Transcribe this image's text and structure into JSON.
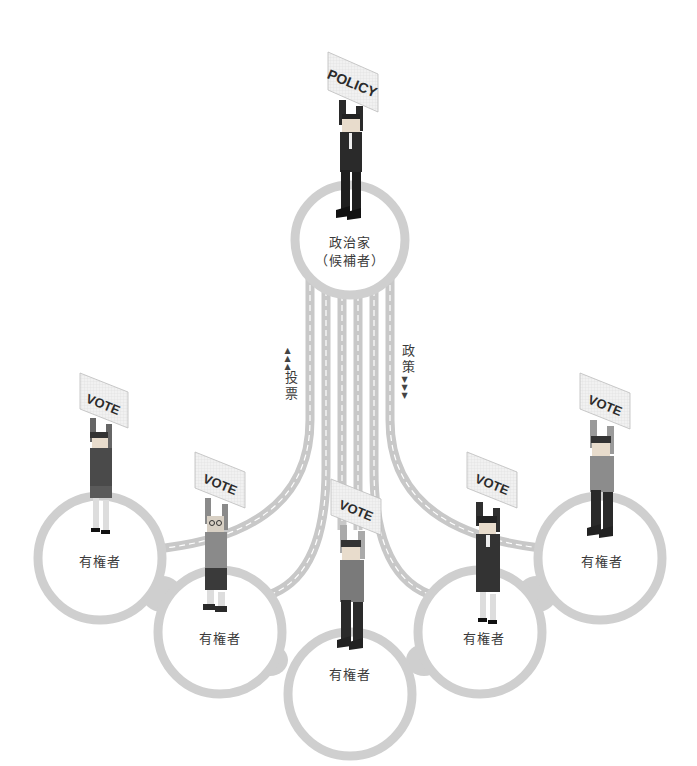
{
  "diagram": {
    "type": "illustration-network",
    "colors": {
      "ring": "#cfcfcf",
      "road": "#c8c8c8",
      "road_line": "#ffffff",
      "text": "#3a3a3a",
      "sign_fill": "#eeeeee",
      "sign_text": "#2b2b2b"
    },
    "politician": {
      "label_line1": "政治家",
      "label_line2": "（候補者）",
      "sign": "POLICY"
    },
    "flows": {
      "up": {
        "arrows": "▲▲▲",
        "chars": [
          "投",
          "票"
        ]
      },
      "down": {
        "chars": [
          "政",
          "策"
        ],
        "arrows": "▼▼▼"
      }
    },
    "voters": [
      {
        "label": "有権者",
        "sign": "VOTE"
      },
      {
        "label": "有権者",
        "sign": "VOTE"
      },
      {
        "label": "有権者",
        "sign": "VOTE"
      },
      {
        "label": "有権者",
        "sign": "VOTE"
      },
      {
        "label": "有権者",
        "sign": "VOTE"
      }
    ]
  }
}
